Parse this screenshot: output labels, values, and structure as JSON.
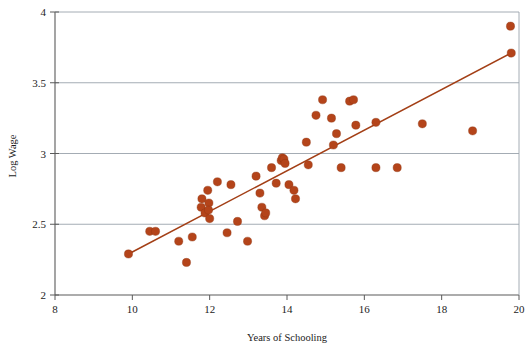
{
  "chart_data": {
    "type": "scatter",
    "title": "",
    "xlabel": "Years of Schooling",
    "ylabel": "Log Wage",
    "xlim": [
      8,
      20
    ],
    "ylim": [
      2,
      4
    ],
    "xticks": [
      8,
      10,
      12,
      14,
      16,
      18,
      20
    ],
    "yticks": [
      2,
      2.5,
      3,
      3.5,
      4
    ],
    "xtick_labels": [
      "8",
      "10",
      "12",
      "14",
      "16",
      "18",
      "20"
    ],
    "ytick_labels": [
      "2",
      "2.5",
      "3",
      "3.5",
      "4"
    ],
    "grid": "horizontal",
    "legend": "none",
    "point_color": "#b4441a",
    "line_color": "#a33f16",
    "axis_color": "#666666",
    "grid_color": "#9aa3ac",
    "series": [
      {
        "name": "observations",
        "marker": "circle",
        "points": [
          [
            9.9,
            2.29
          ],
          [
            10.45,
            2.45
          ],
          [
            10.6,
            2.45
          ],
          [
            11.2,
            2.38
          ],
          [
            11.4,
            2.23
          ],
          [
            11.55,
            2.41
          ],
          [
            11.8,
            2.68
          ],
          [
            11.78,
            2.62
          ],
          [
            11.88,
            2.58
          ],
          [
            11.95,
            2.74
          ],
          [
            11.98,
            2.65
          ],
          [
            11.97,
            2.6
          ],
          [
            12.0,
            2.54
          ],
          [
            12.2,
            2.8
          ],
          [
            12.45,
            2.44
          ],
          [
            12.55,
            2.78
          ],
          [
            12.72,
            2.52
          ],
          [
            12.98,
            2.38
          ],
          [
            13.2,
            2.84
          ],
          [
            13.3,
            2.72
          ],
          [
            13.35,
            2.62
          ],
          [
            13.42,
            2.56
          ],
          [
            13.45,
            2.58
          ],
          [
            13.6,
            2.9
          ],
          [
            13.72,
            2.79
          ],
          [
            13.85,
            2.95
          ],
          [
            13.88,
            2.97
          ],
          [
            13.92,
            2.96
          ],
          [
            13.95,
            2.93
          ],
          [
            14.05,
            2.78
          ],
          [
            14.18,
            2.74
          ],
          [
            14.22,
            2.68
          ],
          [
            14.55,
            2.92
          ],
          [
            14.5,
            3.08
          ],
          [
            14.75,
            3.27
          ],
          [
            14.92,
            3.38
          ],
          [
            15.15,
            3.25
          ],
          [
            15.2,
            3.06
          ],
          [
            15.28,
            3.14
          ],
          [
            15.4,
            2.9
          ],
          [
            15.62,
            3.37
          ],
          [
            15.72,
            3.38
          ],
          [
            15.78,
            3.2
          ],
          [
            16.3,
            3.22
          ],
          [
            16.3,
            2.9
          ],
          [
            16.85,
            2.9
          ],
          [
            17.5,
            3.21
          ],
          [
            18.8,
            3.16
          ],
          [
            19.78,
            3.9
          ],
          [
            19.8,
            3.71
          ]
        ]
      }
    ],
    "trendline": {
      "name": "fitted regression line",
      "x_start": 9.9,
      "y_start": 2.29,
      "x_end": 19.8,
      "y_end": 3.71
    }
  }
}
